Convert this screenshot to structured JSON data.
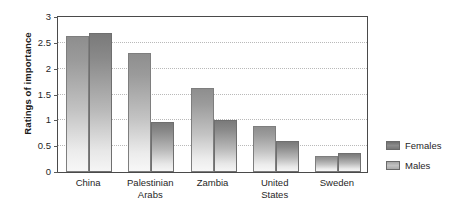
{
  "chart_data": {
    "type": "bar",
    "title": "",
    "xlabel": "",
    "ylabel": "Ratings of importance",
    "ylim": [
      0,
      3
    ],
    "yticks": [
      "0",
      "0.5",
      "1",
      "1.5",
      "2",
      "2.5",
      "3"
    ],
    "ytick_values": [
      0,
      0.5,
      1,
      1.5,
      2,
      2.5,
      3
    ],
    "grid": true,
    "legend_position": "right",
    "categories": [
      "China",
      "Palestinian Arabs",
      "Zambia",
      "United States",
      "Sweden"
    ],
    "category_lines": [
      [
        "China"
      ],
      [
        "Palestinian",
        "Arabs"
      ],
      [
        "Zambia"
      ],
      [
        "United",
        "States"
      ],
      [
        "Sweden"
      ]
    ],
    "series": [
      {
        "name": "Females",
        "color": "#8e8e8e",
        "values": [
          2.6,
          2.28,
          1.6,
          0.88,
          0.3
        ]
      },
      {
        "name": "Males",
        "color": "#7a7a7a",
        "values": [
          2.65,
          0.95,
          1.0,
          0.6,
          0.37
        ]
      }
    ]
  },
  "legend": {
    "items": [
      {
        "label": "Females"
      },
      {
        "label": "Males"
      }
    ]
  }
}
